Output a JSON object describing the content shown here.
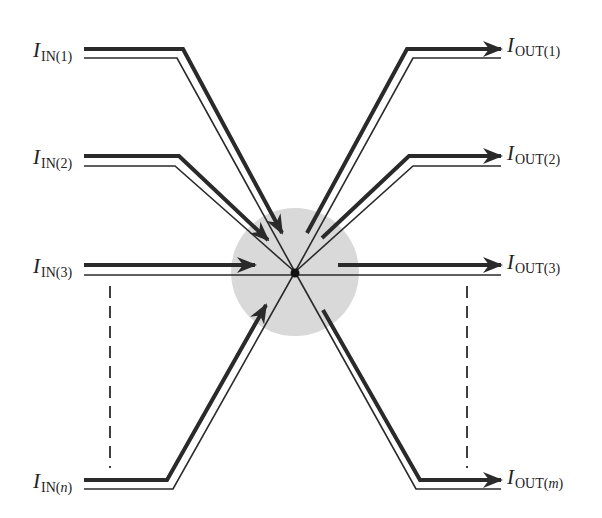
{
  "diagram": {
    "type": "kirchhoff-current-law-junction",
    "colors": {
      "line": "#2a2a2a",
      "junction_region": "#d9d9d9",
      "node": "#111111"
    },
    "inputs": [
      {
        "symbol": "I",
        "subscript": "IN(1)"
      },
      {
        "symbol": "I",
        "subscript": "IN(2)"
      },
      {
        "symbol": "I",
        "subscript": "IN(3)"
      },
      {
        "symbol": "I",
        "subscript_prefix": "IN(",
        "subscript_var": "n",
        "subscript_suffix": ")"
      }
    ],
    "outputs": [
      {
        "symbol": "I",
        "subscript": "OUT(1)"
      },
      {
        "symbol": "I",
        "subscript": "OUT(2)"
      },
      {
        "symbol": "I",
        "subscript": "OUT(3)"
      },
      {
        "symbol": "I",
        "subscript_prefix": "OUT(",
        "subscript_var": "m",
        "subscript_suffix": ")"
      }
    ]
  }
}
